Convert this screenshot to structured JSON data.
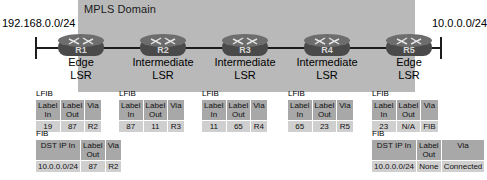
{
  "diagram": {
    "domain_label": "MPLS Domain",
    "networks": {
      "left": "192.168.0.0/24",
      "right": "10.0.0.0/24"
    },
    "routers": [
      {
        "id": "R1",
        "role_line1": "Edge",
        "role_line2": "LSR"
      },
      {
        "id": "R2",
        "role_line1": "Intermediate",
        "role_line2": "LSR"
      },
      {
        "id": "R3",
        "role_line1": "Intermediate",
        "role_line2": "LSR"
      },
      {
        "id": "R4",
        "role_line1": "Intermediate",
        "role_line2": "LSR"
      },
      {
        "id": "R5",
        "role_line1": "Edge",
        "role_line2": "LSR"
      }
    ],
    "lfib_tables": [
      {
        "title": "LFIB",
        "headers": [
          "Label In",
          "Label Out",
          "Via"
        ],
        "header_line1": [
          "Label",
          "Label",
          "Via"
        ],
        "header_line2": [
          "In",
          "Out",
          ""
        ],
        "row": [
          "19",
          "87",
          "R2"
        ]
      },
      {
        "title": "LFIB",
        "headers": [
          "Label In",
          "Label Out",
          "Via"
        ],
        "header_line1": [
          "Label",
          "Label",
          "Via"
        ],
        "header_line2": [
          "In",
          "Out",
          ""
        ],
        "row": [
          "87",
          "11",
          "R3"
        ]
      },
      {
        "title": "LFIB",
        "headers": [
          "Label In",
          "Label Out",
          "Via"
        ],
        "header_line1": [
          "Label",
          "Label",
          "Via"
        ],
        "header_line2": [
          "In",
          "Out",
          ""
        ],
        "row": [
          "11",
          "65",
          "R4"
        ]
      },
      {
        "title": "LFIB",
        "headers": [
          "Label In",
          "Label Out",
          "Via"
        ],
        "header_line1": [
          "Label",
          "Label",
          "Via"
        ],
        "header_line2": [
          "In",
          "Out",
          ""
        ],
        "row": [
          "65",
          "23",
          "R5"
        ]
      },
      {
        "title": "LFIB",
        "headers": [
          "Label In",
          "Label Out",
          "Via"
        ],
        "header_line1": [
          "Label",
          "Label",
          "Via"
        ],
        "header_line2": [
          "In",
          "Out",
          ""
        ],
        "row": [
          "23",
          "N/A",
          "FIB"
        ]
      }
    ],
    "fib_tables": [
      {
        "title": "FIB",
        "header_line1": [
          "DST IP In",
          "Label",
          "Via"
        ],
        "header_line2": [
          "",
          "Out",
          ""
        ],
        "row": [
          "10.0.0.0/24",
          "87",
          "R2"
        ]
      },
      {
        "title": "FIB",
        "header_line1": [
          "DST IP In",
          "Label",
          "Via"
        ],
        "header_line2": [
          "",
          "Out",
          ""
        ],
        "row": [
          "10.0.0.0/24",
          "None",
          "Connected"
        ]
      }
    ]
  }
}
